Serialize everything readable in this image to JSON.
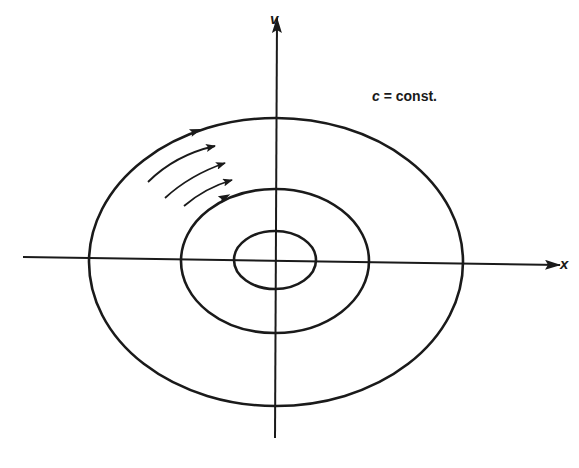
{
  "diagram": {
    "type": "phase-plane-orbits",
    "labels": {
      "x_axis": "x",
      "y_axis": "v",
      "annotation_var": "c",
      "annotation_rest": " = const."
    },
    "colors": {
      "ink": "#1a1a1a",
      "background": "#ffffff"
    },
    "origin": [
      275,
      260
    ],
    "axes": {
      "x": {
        "from": [
          23,
          257
        ],
        "to": [
          560,
          265
        ]
      },
      "y": {
        "from": [
          275,
          438
        ],
        "to": [
          277,
          18
        ]
      }
    },
    "orbits": [
      {
        "name": "inner-orbit",
        "cx": 275,
        "cy": 260,
        "rx": 41,
        "ry": 29
      },
      {
        "name": "middle-orbit",
        "cx": 275,
        "cy": 261,
        "rx": 94,
        "ry": 72
      },
      {
        "name": "outer-orbit",
        "cx": 276,
        "cy": 262,
        "rx": 187,
        "ry": 144
      }
    ],
    "flow_arrows": [
      {
        "path": "M148,182 Q175,155 215,146",
        "tip": [
          218,
          145
        ]
      },
      {
        "path": "M165,198 Q190,175 225,163",
        "tip": [
          228,
          162
        ]
      },
      {
        "path": "M184,206 Q205,188 232,180",
        "tip": [
          234,
          179
        ]
      }
    ],
    "orbit_arrows": [
      {
        "at": [
          196,
          131
        ],
        "angle": -20
      },
      {
        "at": [
          225,
          197
        ],
        "angle": -28
      }
    ]
  }
}
